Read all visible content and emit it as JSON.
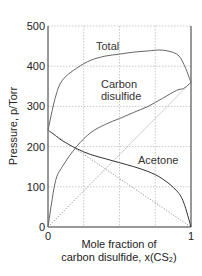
{
  "chart_data": {
    "type": "line",
    "title": "",
    "xlabel_line1": "Mole fraction of",
    "xlabel_line2": "carbon disulfide, x(CS₂)",
    "ylabel": "Pressure, p/Torr",
    "xlim": [
      0,
      1
    ],
    "ylim": [
      0,
      500
    ],
    "xticks": [
      "0",
      "1"
    ],
    "yticks": [
      "0",
      "100",
      "200",
      "300",
      "400",
      "500"
    ],
    "grid": true,
    "legend": "inline annotations",
    "x": [
      0,
      0.05,
      0.1,
      0.2,
      0.3,
      0.4,
      0.5,
      0.6,
      0.7,
      0.8,
      0.9,
      0.95,
      1
    ],
    "series": [
      {
        "name": "Total",
        "values": [
          241,
          320,
          365,
          395,
          415,
          425,
          430,
          435,
          438,
          440,
          430,
          405,
          360
        ]
      },
      {
        "name": "Carbon disulfide",
        "values": [
          0,
          110,
          150,
          200,
          235,
          255,
          270,
          285,
          300,
          320,
          340,
          345,
          360
        ]
      },
      {
        "name": "Acetone",
        "values": [
          241,
          228,
          215,
          195,
          180,
          170,
          160,
          150,
          138,
          120,
          90,
          60,
          0
        ]
      },
      {
        "name": "Ideal CS2 (Raoult, dotted)",
        "values": [
          0,
          18,
          36,
          72,
          108,
          144,
          180,
          216,
          252,
          288,
          324,
          342,
          360
        ]
      },
      {
        "name": "Ideal acetone (Raoult, dotted)",
        "values": [
          241,
          229,
          217,
          193,
          169,
          145,
          121,
          96,
          72,
          48,
          24,
          12,
          0
        ]
      }
    ],
    "annotations": [
      "Total",
      "Carbon",
      "disulfide",
      "Acetone"
    ]
  }
}
